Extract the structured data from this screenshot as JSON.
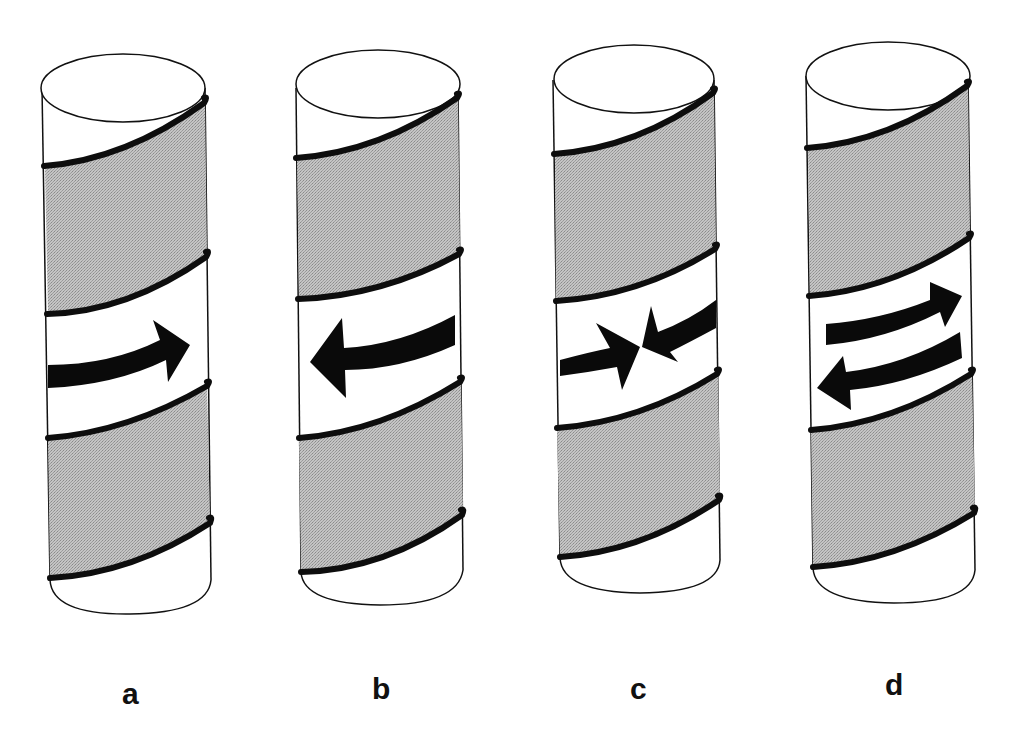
{
  "figure": {
    "type": "diagram",
    "colors": {
      "background": "#ffffff",
      "outline": "#111111",
      "helix_line": "#0d0d0d",
      "shaded_band": "#b8b8b8",
      "arrow": "#0a0a0a",
      "label": "#111111"
    },
    "panels": [
      {
        "label": "a",
        "arrow": "single arrow pointing right"
      },
      {
        "label": "b",
        "arrow": "single arrow pointing left"
      },
      {
        "label": "c",
        "arrow": "two arrows pointing toward each other (converging)"
      },
      {
        "label": "d",
        "arrow": "two parallel arrows, upper pointing right, lower pointing left (opposing)"
      }
    ]
  },
  "labels": {
    "a": "a",
    "b": "b",
    "c": "c",
    "d": "d"
  }
}
